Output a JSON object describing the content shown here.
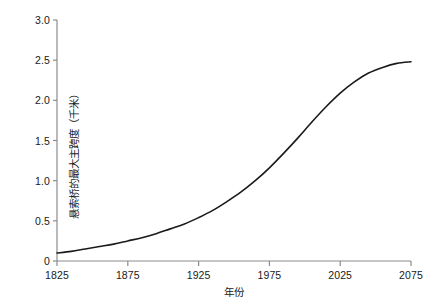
{
  "chart_data": {
    "type": "line",
    "title": "",
    "xlabel": "年份",
    "ylabel": "悬索桥的最大主跨度（千米）",
    "xlim": [
      1825,
      2075
    ],
    "ylim": [
      0,
      3.0
    ],
    "grid": false,
    "legend": null,
    "xticks": [
      1825,
      1875,
      1925,
      1975,
      2025,
      2075
    ],
    "xtick_labels": [
      "1825",
      "1875",
      "1925",
      "1975",
      "2025",
      "2075"
    ],
    "yticks": [
      0,
      0.5,
      1.0,
      1.5,
      2.0,
      2.5,
      3.0
    ],
    "ytick_labels": [
      "0",
      "0.5",
      "1.0",
      "1.5",
      "2.0",
      "2.5",
      "3.0"
    ],
    "series": [
      {
        "name": "悬索桥的最大主跨度",
        "color": "#1a1a1a",
        "line_width": 1.6,
        "x": [
          1825,
          1835,
          1845,
          1855,
          1865,
          1875,
          1885,
          1895,
          1905,
          1915,
          1925,
          1935,
          1945,
          1955,
          1965,
          1975,
          1985,
          1995,
          2005,
          2015,
          2025,
          2035,
          2045,
          2055,
          2065,
          2075
        ],
        "y": [
          0.1,
          0.12,
          0.15,
          0.18,
          0.21,
          0.25,
          0.29,
          0.34,
          0.4,
          0.46,
          0.54,
          0.63,
          0.74,
          0.86,
          1.0,
          1.16,
          1.34,
          1.53,
          1.73,
          1.92,
          2.09,
          2.23,
          2.34,
          2.41,
          2.46,
          2.48
        ]
      }
    ]
  },
  "axes": {
    "axis_color": "#8c8c8c",
    "tick_color": "#8c8c8c",
    "background": "#ffffff"
  },
  "geometry": {
    "plot_left": 57,
    "plot_right": 411,
    "plot_top": 20,
    "plot_bottom": 261
  }
}
